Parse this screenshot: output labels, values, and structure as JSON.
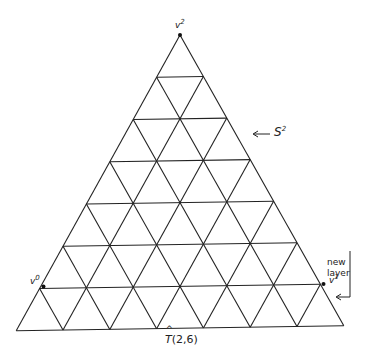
{
  "diagram": {
    "caption": {
      "symbol": "T",
      "args": "(2,6)"
    },
    "vertices": {
      "v2": {
        "base": "v",
        "sup": "2"
      },
      "v0": {
        "base": "v",
        "sup": "0"
      },
      "v1": {
        "base": "v",
        "sup": "1"
      }
    },
    "annotations": {
      "simplex": {
        "base": "S",
        "sup": "2"
      },
      "new_layer": {
        "line1": "new",
        "line2": "layer"
      }
    },
    "geometry": {
      "apex": [
        180,
        35
      ],
      "rows": 7,
      "row_height": 41.9,
      "half_step": 23.4,
      "inner_layers": 6
    },
    "colors": {
      "line": "#222222",
      "background": "#ffffff"
    }
  }
}
